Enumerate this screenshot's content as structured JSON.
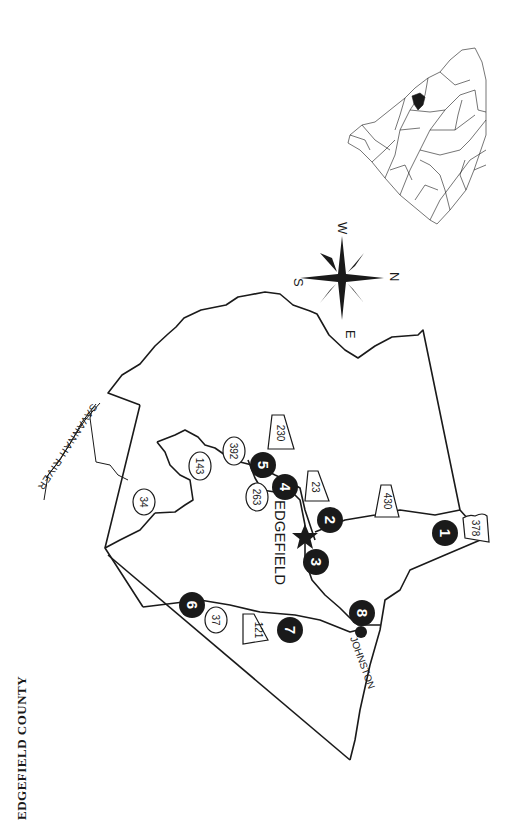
{
  "map": {
    "title": "EDGEFIELD COUNTY",
    "county_seat": "EDGEFIELD",
    "towns": [
      "JOHNSTON"
    ],
    "river": "SAVANNAH RIVER",
    "compass": {
      "n": "N",
      "s": "S",
      "e": "E",
      "w": "W"
    },
    "sites": [
      {
        "label": "1"
      },
      {
        "label": "2"
      },
      {
        "label": "3"
      },
      {
        "label": "4"
      },
      {
        "label": "5"
      },
      {
        "label": "6"
      },
      {
        "label": "7"
      },
      {
        "label": "8"
      }
    ],
    "routes": {
      "state_oval": [
        "34",
        "143",
        "392",
        "263",
        "37"
      ],
      "state_shield": [
        "230",
        "23",
        "430",
        "121"
      ],
      "us": [
        "378"
      ]
    },
    "colors": {
      "ink": "#1a1a1a",
      "background": "#ffffff"
    }
  }
}
